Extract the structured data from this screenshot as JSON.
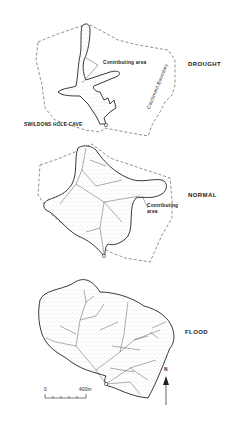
{
  "figure": {
    "panels": [
      {
        "id": "drought",
        "state_label": "DROUGHT",
        "annotations": [
          "Contributing area",
          "SWILDONS HOLE CAVE",
          "Catchment Boundary"
        ]
      },
      {
        "id": "normal",
        "state_label": "NORMAL",
        "annotations": [
          "Contributing",
          "area"
        ]
      },
      {
        "id": "flood",
        "state_label": "FLOOD",
        "annotations": []
      }
    ],
    "scale_bar": {
      "start": "0",
      "end": "400m",
      "ticks": 5
    },
    "north_arrow": {
      "label": "N"
    },
    "colors": {
      "ink": "#1a1a1a",
      "stipple": "#9a9a9a",
      "background": "#ffffff"
    }
  }
}
